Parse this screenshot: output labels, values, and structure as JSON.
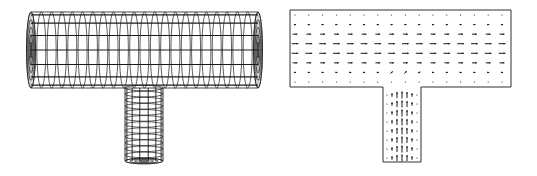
{
  "figure": {
    "panels": [
      {
        "id": "wireframe-mesh",
        "description": "3D wireframe mesh of a T-junction pipe",
        "main_pipe": {
          "x0": 27,
          "x1": 262,
          "y0": 12,
          "y1": 88,
          "rings": 22,
          "long_lines": 8
        },
        "branch_pipe": {
          "x0": 125,
          "x1": 163,
          "y0": 84,
          "y1": 165,
          "rings": 12,
          "long_lines": 7
        }
      },
      {
        "id": "velocity-field",
        "description": "2D velocity vector field in a T-junction cross-section",
        "main_channel": {
          "x0": 290,
          "x1": 511,
          "y0": 10,
          "y1": 87,
          "cols": 16,
          "rows": 8
        },
        "branch_channel": {
          "x0": 383,
          "x1": 421,
          "y0": 87,
          "y1": 162,
          "cols": 7,
          "rows": 8
        }
      }
    ],
    "colors": {
      "line": "#1a1a1a",
      "background": "#ffffff"
    }
  }
}
